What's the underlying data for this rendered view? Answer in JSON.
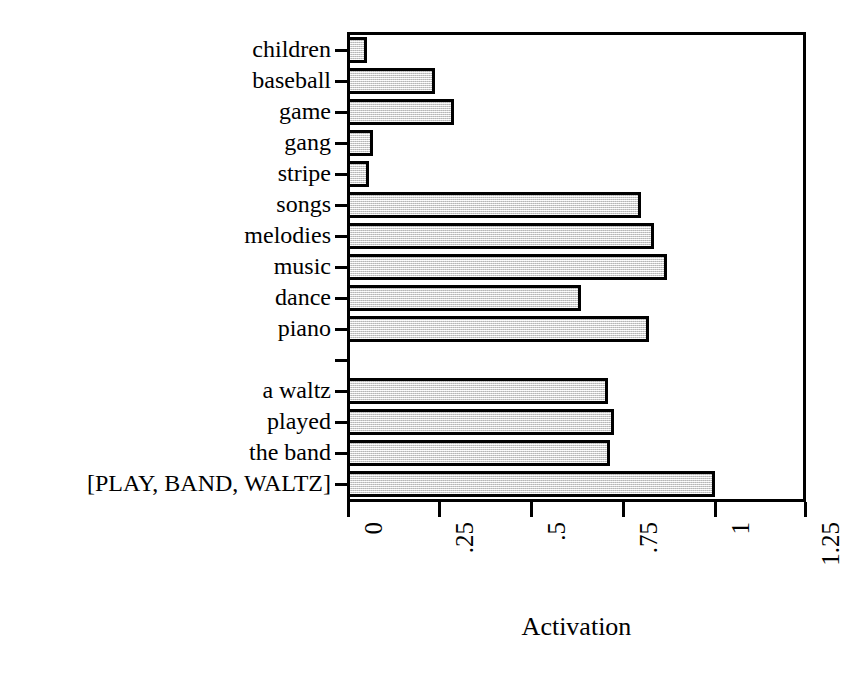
{
  "chart_data": {
    "type": "bar",
    "orientation": "horizontal",
    "title": "",
    "xlabel": "Activation",
    "ylabel": "",
    "xlim": [
      0,
      1.25
    ],
    "xticks": [
      "0",
      ".25",
      ".5",
      ".75",
      "1",
      "1.25"
    ],
    "xtick_values": [
      0,
      0.25,
      0.5,
      0.75,
      1,
      1.25
    ],
    "grid": false,
    "legend": null,
    "bar_facecolor": "#e6e6e6",
    "bar_edgecolor": "#000000",
    "categories": [
      "children",
      "baseball",
      "game",
      "gang",
      "stripe",
      "songs",
      "melodies",
      "music",
      "dance",
      "piano",
      "a waltz",
      "played",
      "the band",
      "[PLAY, BAND, WALTZ]"
    ],
    "values": [
      0.055,
      0.24,
      0.29,
      0.07,
      0.06,
      0.8,
      0.835,
      0.87,
      0.635,
      0.82,
      0.71,
      0.725,
      0.715,
      1.0
    ],
    "groups": [
      {
        "name": "baseball-sense-associates",
        "categories": [
          "children",
          "baseball",
          "game",
          "gang",
          "stripe"
        ]
      },
      {
        "name": "music-sense-associates",
        "categories": [
          "songs",
          "melodies",
          "music",
          "dance",
          "piano"
        ]
      },
      {
        "name": "sentence-words",
        "categories": [
          "a waltz",
          "played",
          "the band"
        ]
      },
      {
        "name": "concept-triple",
        "categories": [
          "[PLAY, BAND, WALTZ]"
        ]
      }
    ]
  }
}
